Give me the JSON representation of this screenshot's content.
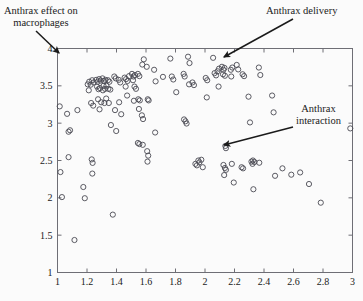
{
  "chart_data": {
    "type": "scatter",
    "title": "",
    "xlabel": "",
    "ylabel": "",
    "xlim": [
      1,
      3
    ],
    "ylim": [
      1,
      4
    ],
    "xticks": [
      1,
      1.2,
      1.4,
      1.6,
      1.8,
      2,
      2.2,
      2.4,
      2.6,
      2.8,
      3
    ],
    "yticks": [
      1,
      1.5,
      2,
      2.5,
      3,
      3.5,
      4
    ],
    "xtick_labels": [
      "1",
      "1.2",
      "1.4",
      "1.6",
      "1.8",
      "2",
      "2.2",
      "2.4",
      "2.6",
      "2.8",
      "3"
    ],
    "ytick_labels": [
      "1",
      "1.5",
      "2",
      "2.5",
      "3",
      "3.5",
      "4"
    ],
    "grid": false,
    "legend": null,
    "marker": {
      "shape": "open-circle",
      "radius_px": 2.6,
      "stroke": "#4a4a52",
      "fill": "none",
      "stroke_width": 0.9
    },
    "frame_color": "#6e6e75",
    "background": "#fbfbfb",
    "series": [
      {
        "name": "points",
        "points": [
          [
            1.015,
            3.225
          ],
          [
            1.02,
            2.345
          ],
          [
            1.03,
            2.01
          ],
          [
            1.065,
            3.125
          ],
          [
            1.075,
            2.885
          ],
          [
            1.085,
            2.905
          ],
          [
            1.075,
            2.545
          ],
          [
            1.115,
            1.435
          ],
          [
            1.135,
            3.175
          ],
          [
            1.175,
            2.145
          ],
          [
            1.185,
            1.995
          ],
          [
            1.205,
            3.52
          ],
          [
            1.215,
            3.555
          ],
          [
            1.225,
            3.515
          ],
          [
            1.212,
            3.44
          ],
          [
            1.235,
            3.575
          ],
          [
            1.245,
            3.545
          ],
          [
            1.228,
            3.27
          ],
          [
            1.242,
            3.235
          ],
          [
            1.232,
            2.515
          ],
          [
            1.238,
            2.468
          ],
          [
            1.236,
            2.325
          ],
          [
            1.262,
            3.58
          ],
          [
            1.272,
            3.555
          ],
          [
            1.282,
            3.59
          ],
          [
            1.292,
            3.57
          ],
          [
            1.268,
            3.49
          ],
          [
            1.278,
            3.455
          ],
          [
            1.288,
            3.47
          ],
          [
            1.275,
            3.32
          ],
          [
            1.296,
            3.28
          ],
          [
            1.285,
            3.185
          ],
          [
            1.305,
            3.6
          ],
          [
            1.315,
            3.565
          ],
          [
            1.325,
            3.58
          ],
          [
            1.312,
            3.5
          ],
          [
            1.322,
            3.46
          ],
          [
            1.332,
            3.5
          ],
          [
            1.308,
            3.44
          ],
          [
            1.33,
            3.33
          ],
          [
            1.318,
            3.27
          ],
          [
            1.342,
            3.575
          ],
          [
            1.352,
            3.555
          ],
          [
            1.345,
            3.46
          ],
          [
            1.358,
            3.45
          ],
          [
            1.348,
            3.27
          ],
          [
            1.362,
            2.975
          ],
          [
            1.385,
            3.625
          ],
          [
            1.395,
            3.6
          ],
          [
            1.39,
            3.175
          ],
          [
            1.398,
            2.895
          ],
          [
            1.375,
            1.775
          ],
          [
            1.415,
            3.58
          ],
          [
            1.425,
            3.545
          ],
          [
            1.418,
            3.28
          ],
          [
            1.432,
            3.12
          ],
          [
            1.455,
            3.61
          ],
          [
            1.465,
            3.59
          ],
          [
            1.475,
            3.565
          ],
          [
            1.462,
            3.49
          ],
          [
            1.472,
            3.37
          ],
          [
            1.485,
            3.63
          ],
          [
            1.505,
            3.66
          ],
          [
            1.515,
            3.625
          ],
          [
            1.525,
            3.645
          ],
          [
            1.512,
            3.575
          ],
          [
            1.522,
            3.49
          ],
          [
            1.532,
            3.46
          ],
          [
            1.518,
            3.3
          ],
          [
            1.545,
            3.66
          ],
          [
            1.555,
            3.63
          ],
          [
            1.548,
            3.32
          ],
          [
            1.558,
            3.305
          ],
          [
            1.552,
            3.19
          ],
          [
            1.545,
            2.735
          ],
          [
            1.555,
            2.72
          ],
          [
            1.575,
            3.785
          ],
          [
            1.585,
            3.855
          ],
          [
            1.572,
            3.105
          ],
          [
            1.58,
            3.055
          ],
          [
            1.578,
            2.71
          ],
          [
            1.605,
            3.755
          ],
          [
            1.612,
            3.32
          ],
          [
            1.618,
            3.305
          ],
          [
            1.608,
            2.625
          ],
          [
            1.615,
            2.565
          ],
          [
            1.61,
            2.485
          ],
          [
            1.655,
            3.715
          ],
          [
            1.665,
            3.56
          ],
          [
            1.662,
            2.875
          ],
          [
            1.715,
            3.62
          ],
          [
            1.765,
            3.865
          ],
          [
            1.775,
            3.625
          ],
          [
            1.785,
            3.585
          ],
          [
            1.805,
            3.415
          ],
          [
            1.855,
            3.66
          ],
          [
            1.862,
            3.625
          ],
          [
            1.858,
            3.05
          ],
          [
            1.868,
            3.025
          ],
          [
            1.875,
            2.995
          ],
          [
            1.885,
            3.89
          ],
          [
            1.895,
            3.805
          ],
          [
            1.892,
            3.52
          ],
          [
            1.915,
            3.545
          ],
          [
            1.925,
            3.51
          ],
          [
            1.935,
            2.455
          ],
          [
            1.945,
            2.435
          ],
          [
            1.955,
            2.5
          ],
          [
            1.962,
            2.475
          ],
          [
            1.975,
            2.51
          ],
          [
            1.985,
            2.41
          ],
          [
            2.005,
            3.605
          ],
          [
            2.015,
            3.575
          ],
          [
            2.012,
            3.345
          ],
          [
            2.055,
            3.875
          ],
          [
            2.065,
            3.67
          ],
          [
            2.075,
            3.64
          ],
          [
            2.085,
            3.695
          ],
          [
            2.095,
            3.73
          ],
          [
            2.092,
            3.49
          ],
          [
            2.115,
            3.755
          ],
          [
            2.125,
            3.715
          ],
          [
            2.132,
            3.74
          ],
          [
            2.122,
            3.655
          ],
          [
            2.135,
            3.635
          ],
          [
            2.138,
            2.695
          ],
          [
            2.142,
            2.665
          ],
          [
            2.125,
            2.44
          ],
          [
            2.135,
            2.4
          ],
          [
            2.142,
            2.375
          ],
          [
            2.13,
            2.305
          ],
          [
            2.175,
            3.715
          ],
          [
            2.185,
            3.745
          ],
          [
            2.178,
            3.625
          ],
          [
            2.182,
            2.455
          ],
          [
            2.195,
            2.205
          ],
          [
            2.215,
            3.78
          ],
          [
            2.225,
            3.72
          ],
          [
            2.255,
            3.655
          ],
          [
            2.265,
            3.63
          ],
          [
            2.248,
            2.41
          ],
          [
            2.258,
            2.395
          ],
          [
            2.295,
            3.355
          ],
          [
            2.305,
            3.01
          ],
          [
            2.315,
            2.485
          ],
          [
            2.325,
            2.5
          ],
          [
            2.335,
            2.48
          ],
          [
            2.322,
            2.455
          ],
          [
            2.328,
            2.115
          ],
          [
            2.365,
            3.745
          ],
          [
            2.375,
            3.645
          ],
          [
            2.368,
            2.47
          ],
          [
            2.455,
            3.37
          ],
          [
            2.465,
            3.145
          ],
          [
            2.475,
            2.295
          ],
          [
            2.525,
            2.395
          ],
          [
            2.585,
            2.31
          ],
          [
            2.645,
            2.34
          ],
          [
            2.705,
            2.185
          ],
          [
            2.785,
            1.935
          ],
          [
            2.985,
            2.93
          ]
        ]
      }
    ],
    "annotations": [
      {
        "id": "macrophages",
        "lines": [
          "Anthrax effect on",
          "macrophages"
        ],
        "text_x": 4,
        "text_y": 5,
        "arrow_from": [
          36,
          31
        ],
        "arrow_to": [
          59,
          53
        ]
      },
      {
        "id": "delivery",
        "lines": [
          "Anthrax delivery"
        ],
        "text_x": 266,
        "text_y": 5,
        "arrow_from": [
          293,
          19
        ],
        "arrow_to": [
          224,
          57
        ]
      },
      {
        "id": "interaction",
        "lines": [
          "Anthrax",
          "interaction"
        ],
        "text_x": 296,
        "text_y": 103,
        "arrow_from": [
          293,
          127
        ],
        "arrow_to": [
          224,
          145
        ]
      }
    ]
  }
}
